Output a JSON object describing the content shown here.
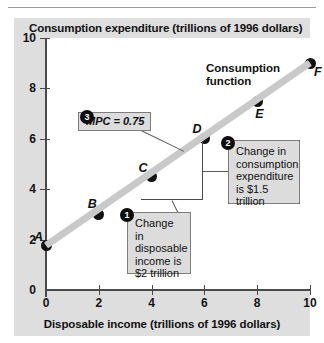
{
  "figure": {
    "y_axis_title": "Consumption expenditure (trillions of 1996 dollars)",
    "x_axis_title": "Disposable income (trillions of 1996 dollars)",
    "curve_label_line1": "Consumption",
    "curve_label_line2": "function"
  },
  "callouts": [
    {
      "number": "1",
      "text": "Change in disposable income is $2 trillion"
    },
    {
      "number": "2",
      "text": "Change in consumption expenditure is $1.5 trillion"
    },
    {
      "number": "3",
      "text": "MPC = 0.75"
    }
  ],
  "chart_data": {
    "type": "line",
    "title": "",
    "xlabel": "Disposable income (trillions of 1996 dollars)",
    "ylabel": "Consumption expenditure (trillions of 1996 dollars)",
    "xlim": [
      0,
      10
    ],
    "ylim": [
      0,
      10
    ],
    "xticks": [
      0,
      2,
      4,
      6,
      8,
      10
    ],
    "yticks": [
      0,
      2,
      4,
      6,
      8,
      10
    ],
    "grid": false,
    "legend": "none",
    "series": [
      {
        "name": "Consumption function",
        "point_labels": [
          "A",
          "B",
          "C",
          "D",
          "E",
          "F"
        ],
        "x": [
          0,
          2,
          4,
          6,
          8,
          10
        ],
        "y": [
          1.75,
          3.0,
          4.5,
          6.0,
          7.5,
          9.0
        ]
      }
    ],
    "annotations": [
      "MPC = 0.75",
      "Change in disposable income is $2 trillion",
      "Change in consumption expenditure is $1.5 trillion"
    ]
  }
}
